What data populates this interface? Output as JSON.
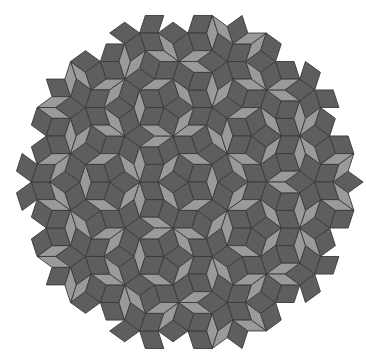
{
  "figure": {
    "title": "Penrose rhombus tiling (P3)",
    "kind": "penrose-p3",
    "symmetry": "5-fold (decagonal patch)",
    "tile_types": [
      {
        "name": "thick-rhomb",
        "angle_deg": 72,
        "fill": "#9a9a9a"
      },
      {
        "name": "thin-rhomb",
        "angle_deg": 36,
        "fill": "#5e5e5e"
      }
    ],
    "outline_color": "#3a3a3a",
    "background_color": "#ffffff",
    "subdivision_generations": 5
  }
}
